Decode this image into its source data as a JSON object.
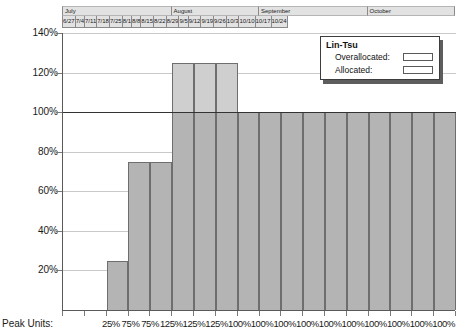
{
  "timeline": {
    "months": [
      {
        "label": "July",
        "weeks": 5
      },
      {
        "label": "August",
        "weeks": 4
      },
      {
        "label": "September",
        "weeks": 5
      },
      {
        "label": "October",
        "weeks": 4
      }
    ],
    "weeks": [
      "6/27",
      "7/4",
      "7/11",
      "7/18",
      "7/25",
      "8/1",
      "8/8",
      "8/15",
      "8/22",
      "8/29",
      "9/5",
      "9/12",
      "9/19",
      "9/26",
      "10/3",
      "10/10",
      "10/17",
      "10/24"
    ]
  },
  "legend": {
    "title": "Lin-Tsu",
    "overallocated_label": "Overallocated:",
    "allocated_label": "Allocated:",
    "overallocated_color": "#cfcfcf",
    "allocated_color": "#b4b4b4"
  },
  "axis": {
    "peak_units_label": "Peak Units:",
    "y_ticks": [
      "140%",
      "120%",
      "100%",
      "80%",
      "60%",
      "40%",
      "20%"
    ],
    "baseline_value": 100
  },
  "chart_data": {
    "type": "bar",
    "title": "",
    "xlabel": "",
    "ylabel": "",
    "ylim": [
      0,
      140
    ],
    "grid": true,
    "legend_position": "top-right",
    "baseline": 100,
    "categories": [
      "6/27",
      "7/4",
      "7/11",
      "7/18",
      "7/25",
      "8/1",
      "8/8",
      "8/15",
      "8/22",
      "8/29",
      "9/5",
      "9/12",
      "9/19",
      "9/26",
      "10/3",
      "10/10",
      "10/17",
      "10/24"
    ],
    "peak_unit_labels": [
      "",
      "",
      "25%",
      "75%",
      "75%",
      "125%",
      "125%",
      "125%",
      "100%",
      "100%",
      "100%",
      "100%",
      "100%",
      "100%",
      "100%",
      "100%",
      "100%",
      "100%"
    ],
    "series": [
      {
        "name": "Lin-Tsu",
        "values": [
          0,
          0,
          25,
          75,
          75,
          125,
          125,
          125,
          100,
          100,
          100,
          100,
          100,
          100,
          100,
          100,
          100,
          100
        ]
      }
    ]
  }
}
